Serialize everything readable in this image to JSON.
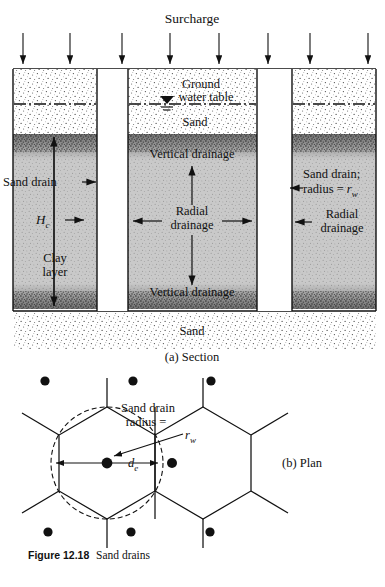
{
  "figure": {
    "number_label": "Figure 12.18",
    "title": "Sand drains"
  },
  "section": {
    "part_label": "(a) Section",
    "surcharge_label": "Surcharge",
    "ground_water_table_label_line1": "Ground",
    "ground_water_table_label_line2": "water table",
    "top_sand_label": "Sand",
    "bottom_sand_label": "Sand",
    "sand_drain_left_label": "Sand drain",
    "clay_layer_line1": "Clay",
    "clay_layer_line2": "layer",
    "thickness_symbol": "H",
    "thickness_subscript": "c",
    "vertical_drainage_top_label": "Vertical drainage",
    "vertical_drainage_bottom_label": "Vertical drainage",
    "radial_drainage_center_line1": "Radial",
    "radial_drainage_center_line2": "drainage",
    "radial_drainage_right_line1": "Radial",
    "radial_drainage_right_line2": "drainage",
    "sand_drain_right_line1": "Sand drain;",
    "sand_drain_right_line2_prefix": "radius = ",
    "sand_drain_right_radius_symbol": "r",
    "sand_drain_right_radius_subscript": "w",
    "surcharge_arrow_count": 8
  },
  "plan": {
    "part_label": "(b) Plan",
    "sand_drain_line1": "Sand drain",
    "sand_drain_line2": "radius =",
    "radius_symbol": "r",
    "radius_subscript": "w",
    "diameter_symbol": "d",
    "diameter_subscript": "e",
    "drain_dot_count": 9
  },
  "colors": {
    "clay_fill": "#c9c9c9",
    "sand_fill": "#ffffff",
    "line": "#111111",
    "drain_fill": "#ffffff",
    "speckle": "#3a3a3a"
  }
}
